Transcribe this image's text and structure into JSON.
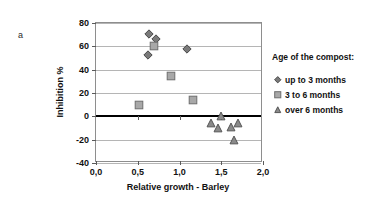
{
  "panel": {
    "label": "a"
  },
  "chart_data": {
    "type": "scatter",
    "title": "",
    "xlabel": "Relative growth - Barley",
    "ylabel": "Inhibition %",
    "xlim": [
      0.0,
      2.0
    ],
    "ylim": [
      -40,
      80
    ],
    "xticks": [
      "0,0",
      "0,5",
      "1,0",
      "1,5",
      "2,0"
    ],
    "xtick_values": [
      0.0,
      0.5,
      1.0,
      1.5,
      2.0
    ],
    "yticks": [
      "80",
      "60",
      "40",
      "20",
      "0",
      "-20",
      "-40"
    ],
    "ytick_values": [
      80,
      60,
      40,
      20,
      0,
      -20,
      -40
    ],
    "grid": true,
    "zero_line": true,
    "legend_position": "right",
    "legend_title": "Age of the compost:",
    "series": [
      {
        "name": "up to 3 months",
        "marker": "diamond",
        "fill": "#7a7a7a",
        "stroke": "#4a4a4a",
        "points": [
          {
            "x": 0.63,
            "y": 71
          },
          {
            "x": 0.72,
            "y": 66
          },
          {
            "x": 0.62,
            "y": 53
          },
          {
            "x": 1.09,
            "y": 58
          }
        ]
      },
      {
        "name": "3 to 6 months",
        "marker": "square",
        "fill": "#a8a8a8",
        "stroke": "#6e6e6e",
        "points": [
          {
            "x": 0.7,
            "y": 60
          },
          {
            "x": 0.9,
            "y": 35
          },
          {
            "x": 0.52,
            "y": 10
          },
          {
            "x": 1.16,
            "y": 14
          }
        ]
      },
      {
        "name": "over 6 months",
        "marker": "triangle",
        "fill": "#8a8a8a",
        "stroke": "#555555",
        "points": [
          {
            "x": 1.5,
            "y": 0
          },
          {
            "x": 1.38,
            "y": -6
          },
          {
            "x": 1.46,
            "y": -10
          },
          {
            "x": 1.62,
            "y": -9
          },
          {
            "x": 1.7,
            "y": -6
          },
          {
            "x": 1.65,
            "y": -20
          }
        ]
      }
    ]
  },
  "colors": {
    "axis": "#8e8e8e",
    "grid": "#b5b5b5",
    "zero": "#000000",
    "text": "#111111"
  }
}
